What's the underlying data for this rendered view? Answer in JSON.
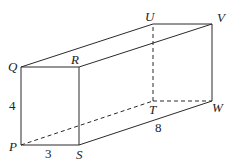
{
  "figure": {
    "type": "rectangular-prism",
    "vertices": [
      "P",
      "Q",
      "R",
      "S",
      "T",
      "U",
      "V",
      "W"
    ],
    "visible_edges": [
      [
        "P",
        "Q"
      ],
      [
        "Q",
        "R"
      ],
      [
        "R",
        "S"
      ],
      [
        "S",
        "P"
      ],
      [
        "Q",
        "U"
      ],
      [
        "U",
        "V"
      ],
      [
        "R",
        "V"
      ],
      [
        "V",
        "W"
      ],
      [
        "S",
        "W"
      ]
    ],
    "hidden_edges": [
      [
        "P",
        "T"
      ],
      [
        "T",
        "U"
      ],
      [
        "T",
        "W"
      ]
    ],
    "dimensions": [
      {
        "edge": [
          "P",
          "Q"
        ],
        "label": "4"
      },
      {
        "edge": [
          "P",
          "S"
        ],
        "label": "3"
      },
      {
        "edge": [
          "S",
          "W"
        ],
        "label": "8"
      }
    ]
  },
  "labels": {
    "P": "P",
    "Q": "Q",
    "R": "R",
    "S": "S",
    "T": "T",
    "U": "U",
    "V": "V",
    "W": "W",
    "height": "4",
    "width": "3",
    "length": "8"
  }
}
